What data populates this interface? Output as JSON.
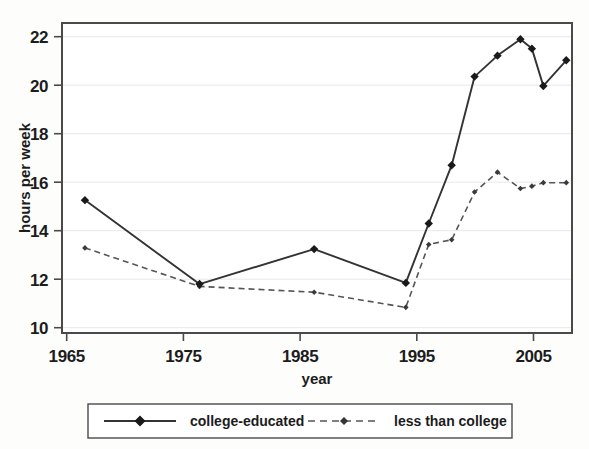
{
  "chart_data": {
    "type": "line",
    "title": "",
    "subtitle": "",
    "xlabel": "year",
    "ylabel": "hours per week",
    "xlim": [
      1963,
      2007.5
    ],
    "ylim": [
      9.6,
      22.9
    ],
    "xticks": [
      1965,
      1975,
      1985,
      1995,
      2005
    ],
    "yticks": [
      10,
      12,
      14,
      16,
      18,
      20,
      22
    ],
    "xtick_labels": [
      "1965",
      "1975",
      "1985",
      "1995",
      "2005"
    ],
    "ytick_labels": [
      "10",
      "12",
      "14",
      "16",
      "18",
      "20",
      "22"
    ],
    "grid": "horizontal",
    "legend_position": "below",
    "series": [
      {
        "name": "college-educated",
        "style": "solid",
        "marker": "diamond",
        "color": "#333333",
        "x": [
          1965,
          1975,
          1985,
          1993,
          1995,
          1997,
          1999,
          2001,
          2003,
          2004,
          2005,
          2007
        ],
        "values": [
          15.3,
          11.7,
          13.2,
          11.75,
          14.3,
          16.8,
          20.6,
          21.5,
          22.2,
          21.8,
          20.2,
          21.3
        ]
      },
      {
        "name": "less than college",
        "style": "dashed",
        "marker": "small-diamond",
        "color": "#555555",
        "x": [
          1965,
          1975,
          1985,
          1993,
          1995,
          1997,
          1999,
          2001,
          2003,
          2004,
          2005,
          2007
        ],
        "values": [
          13.25,
          11.6,
          11.35,
          10.7,
          13.4,
          13.6,
          15.65,
          16.5,
          15.8,
          15.9,
          16.05,
          16.05
        ]
      }
    ]
  },
  "axes": {
    "y_axis_title": "hours per week",
    "x_axis_title": "year",
    "y_tick_0": "10",
    "y_tick_1": "12",
    "y_tick_2": "14",
    "y_tick_3": "16",
    "y_tick_4": "18",
    "y_tick_5": "20",
    "y_tick_6": "22",
    "x_tick_0": "1965",
    "x_tick_1": "1975",
    "x_tick_2": "1985",
    "x_tick_3": "1995",
    "x_tick_4": "2005"
  },
  "legend": {
    "entry_0_label": "college-educated",
    "entry_1_label": "less than college"
  },
  "colors": {
    "series_solid": "#333333",
    "series_dashed": "#555555",
    "frame": "#4a4a4a",
    "gridline": "#e6e6e6",
    "background": "#ffffff"
  }
}
